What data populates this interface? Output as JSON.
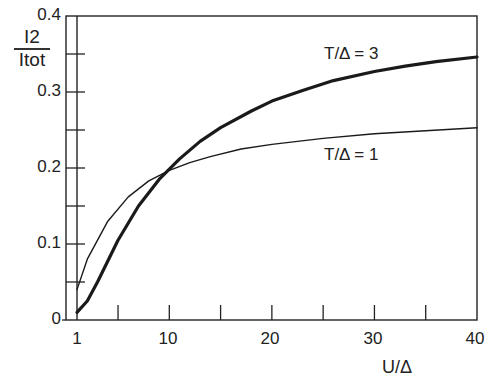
{
  "chart_data": {
    "type": "line",
    "title": "",
    "xlabel": "U/Δ",
    "ylabel_num": "I2",
    "ylabel_den": "Itot",
    "xlim": [
      1,
      40
    ],
    "ylim": [
      0,
      0.4
    ],
    "grid": false,
    "x_tick_labels": [
      "1",
      "10",
      "20",
      "30",
      "40"
    ],
    "x_ticks": [
      1,
      10,
      20,
      30,
      40
    ],
    "x_minor_ticks": [
      5,
      15,
      25,
      35
    ],
    "y_tick_labels": [
      "0",
      "0.1",
      "0.2",
      "0.3",
      "0.4"
    ],
    "y_ticks": [
      0,
      0.1,
      0.2,
      0.3,
      0.4
    ],
    "y_minor_ticks": [
      0.05,
      0.15,
      0.25,
      0.35
    ],
    "series": [
      {
        "name": "T/Δ = 3",
        "label": "T/Δ = 3",
        "style": "thick",
        "x": [
          1,
          2,
          3,
          5,
          7,
          9,
          11,
          13,
          15,
          18,
          20,
          23,
          26,
          30,
          33,
          36,
          40
        ],
        "values": [
          0.01,
          0.025,
          0.05,
          0.105,
          0.15,
          0.185,
          0.212,
          0.235,
          0.253,
          0.275,
          0.288,
          0.302,
          0.315,
          0.327,
          0.334,
          0.34,
          0.346
        ]
      },
      {
        "name": "T/Δ = 1",
        "label": "T/Δ = 1",
        "style": "thin",
        "x": [
          1,
          2,
          4,
          6,
          8,
          10,
          12,
          14,
          17,
          20,
          25,
          30,
          35,
          40
        ],
        "values": [
          0.04,
          0.08,
          0.13,
          0.162,
          0.183,
          0.197,
          0.207,
          0.215,
          0.225,
          0.231,
          0.239,
          0.245,
          0.249,
          0.253
        ]
      }
    ]
  }
}
